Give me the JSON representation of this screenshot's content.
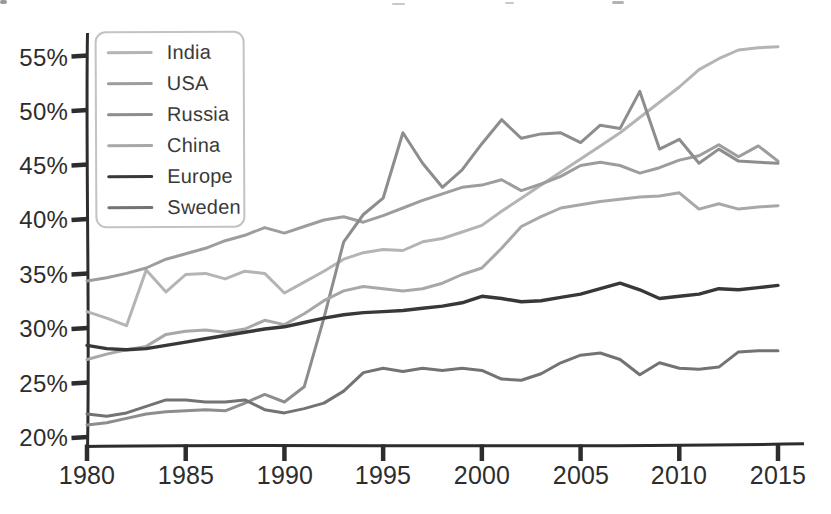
{
  "chart_data": {
    "type": "line",
    "x": [
      1980,
      1981,
      1982,
      1983,
      1984,
      1985,
      1986,
      1987,
      1988,
      1989,
      1990,
      1991,
      1992,
      1993,
      1994,
      1995,
      1996,
      1997,
      1998,
      1999,
      2000,
      2001,
      2002,
      2003,
      2004,
      2005,
      2006,
      2007,
      2008,
      2009,
      2010,
      2011,
      2012,
      2013,
      2014,
      2015
    ],
    "x_tick_labels": [
      "1980",
      "1985",
      "1990",
      "1995",
      "2000",
      "2005",
      "2010",
      "2015"
    ],
    "y_tick_labels": [
      "20%",
      "25%",
      "30%",
      "35%",
      "40%",
      "45%",
      "50%",
      "55%"
    ],
    "y_ticks": [
      20,
      25,
      30,
      35,
      40,
      45,
      50,
      55
    ],
    "xlim": [
      1980,
      2015
    ],
    "ylim": [
      20,
      55
    ],
    "unit": "%",
    "grid": false,
    "legend_position": "top-left",
    "axis_color": "#2d2d2d",
    "series": [
      {
        "name": "India",
        "color": "#b4b4b4",
        "values": [
          31.6,
          31.0,
          30.3,
          35.4,
          33.4,
          35.0,
          35.1,
          34.6,
          35.3,
          35.1,
          33.3,
          34.3,
          35.3,
          36.4,
          37.0,
          37.3,
          37.2,
          38.0,
          38.3,
          38.9,
          39.5,
          40.8,
          42.0,
          43.2,
          44.4,
          45.6,
          46.8,
          48.0,
          49.4,
          50.8,
          52.2,
          53.8,
          54.8,
          55.6,
          55.8,
          55.9
        ]
      },
      {
        "name": "USA",
        "color": "#9d9d9d",
        "values": [
          34.4,
          34.7,
          35.1,
          35.6,
          36.4,
          36.9,
          37.4,
          38.1,
          38.6,
          39.3,
          38.8,
          39.4,
          40.0,
          40.3,
          39.8,
          40.4,
          41.1,
          41.8,
          42.4,
          43.0,
          43.2,
          43.7,
          42.7,
          43.3,
          44.0,
          45.0,
          45.3,
          45.0,
          44.3,
          44.8,
          45.5,
          45.9,
          46.9,
          45.8,
          46.8,
          45.4
        ]
      },
      {
        "name": "Russia",
        "color": "#8d8d8d",
        "values": [
          21.2,
          21.4,
          21.8,
          22.2,
          22.4,
          22.5,
          22.6,
          22.5,
          23.2,
          24.0,
          23.3,
          24.7,
          31.0,
          38.0,
          40.5,
          42.0,
          48.0,
          45.2,
          43.0,
          44.6,
          47.0,
          49.2,
          47.5,
          47.9,
          48.0,
          47.1,
          48.7,
          48.4,
          51.8,
          46.5,
          47.4,
          45.2,
          46.5,
          45.4,
          45.3,
          45.2
        ]
      },
      {
        "name": "China",
        "color": "#a8a8a8",
        "values": [
          27.2,
          27.7,
          28.1,
          28.4,
          29.5,
          29.8,
          29.9,
          29.7,
          30.0,
          30.8,
          30.4,
          31.4,
          32.6,
          33.5,
          33.9,
          33.7,
          33.5,
          33.7,
          34.2,
          35.0,
          35.6,
          37.4,
          39.4,
          40.3,
          41.1,
          41.4,
          41.7,
          41.9,
          42.1,
          42.2,
          42.5,
          41.0,
          41.5,
          41.0,
          41.2,
          41.3
        ]
      },
      {
        "name": "Europe",
        "color": "#383838",
        "values": [
          28.5,
          28.2,
          28.1,
          28.2,
          28.5,
          28.8,
          29.1,
          29.4,
          29.7,
          30.0,
          30.2,
          30.6,
          31.0,
          31.3,
          31.5,
          31.6,
          31.7,
          31.9,
          32.1,
          32.4,
          33.0,
          32.8,
          32.5,
          32.6,
          32.9,
          33.2,
          33.7,
          34.2,
          33.6,
          32.8,
          33.0,
          33.2,
          33.7,
          33.6,
          33.8,
          34.0
        ]
      },
      {
        "name": "Sweden",
        "color": "#737373",
        "values": [
          22.2,
          22.0,
          22.3,
          22.9,
          23.5,
          23.5,
          23.3,
          23.3,
          23.5,
          22.6,
          22.3,
          22.7,
          23.2,
          24.3,
          26.0,
          26.4,
          26.1,
          26.4,
          26.2,
          26.4,
          26.2,
          25.4,
          25.3,
          25.9,
          26.9,
          27.6,
          27.8,
          27.2,
          25.8,
          26.9,
          26.4,
          26.3,
          26.5,
          27.9,
          28.0,
          28.0
        ]
      }
    ]
  }
}
